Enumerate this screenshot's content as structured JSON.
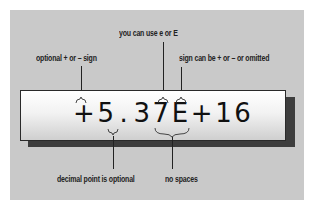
{
  "diagram": {
    "expression": "+5.37E+16",
    "parts": {
      "sign": "+",
      "mantissa_int": "5",
      "decimal_point": ".",
      "mantissa_frac": "37",
      "exponent_marker": "E",
      "exponent_sign": "+",
      "exponent_digits": "16"
    },
    "annotations": {
      "sign": "optional + or – sign",
      "exponent_marker": "you can use e or E",
      "exponent_sign": "sign can be + or – or omitted",
      "decimal_point": "decimal point is optional",
      "no_spaces": "no spaces"
    },
    "colors": {
      "background_panel": "#c9c9c9",
      "box_top": "#ffffff",
      "box_bottom": "#cfcfcf",
      "shadow": "#3d3d3d",
      "text": "#222222"
    }
  }
}
